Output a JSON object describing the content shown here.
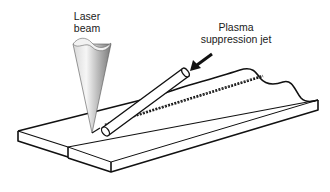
{
  "diagram": {
    "labels": {
      "laser_beam_line1": "Laser",
      "laser_beam_line2": "beam",
      "jet_line1": "Plasma",
      "jet_line2": "suppression jet"
    },
    "components": [
      {
        "name": "laser-beam-cone",
        "shape": "inverted cone"
      },
      {
        "name": "plasma-suppression-jet-tube",
        "shape": "angled tube"
      },
      {
        "name": "workpiece-plates",
        "shape": "two butted flat plates"
      },
      {
        "name": "weld-seam",
        "shape": "beaded seam along joint"
      },
      {
        "name": "pointer-arrow",
        "shape": "arrow pointing to tube"
      }
    ],
    "colors": {
      "stroke": "#111111",
      "background": "#ffffff",
      "cone_light": "#f4f4f4",
      "cone_dark": "#8a8a8a"
    }
  }
}
